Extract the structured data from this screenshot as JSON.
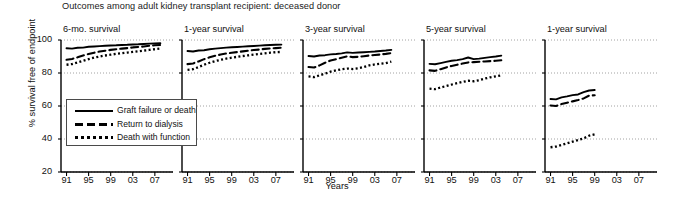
{
  "chart_data": {
    "type": "line",
    "title": "Outcomes among adult kidney transplant recipient: deceased donor",
    "xlabel": "Years",
    "ylabel": "% survival free of endpoint",
    "ylim": [
      20,
      100
    ],
    "yticks": [
      20,
      40,
      60,
      80,
      100
    ],
    "ytick_labels": [
      "20",
      "40",
      "60",
      "80",
      "100"
    ],
    "xticks": [
      91,
      95,
      99,
      3,
      7
    ],
    "xtick_labels": [
      "91",
      "95",
      "99",
      "03",
      "07"
    ],
    "xlim": [
      1990,
      2009
    ],
    "grid": "horizontal-dotted",
    "legend_position": "inside-lower-left-panel-1",
    "legend": [
      {
        "label": "Graft failure or death",
        "style": "solid"
      },
      {
        "label": "Return to dialysis",
        "style": "dashed"
      },
      {
        "label": "Death with function",
        "style": "dotted"
      }
    ],
    "panels": [
      {
        "title": "6-mo. survival",
        "x": [
          1991,
          1992,
          1993,
          1994,
          1995,
          1996,
          1997,
          1998,
          1999,
          2000,
          2001,
          2002,
          2003,
          2004,
          2005,
          2006,
          2007,
          2008
        ],
        "series": [
          {
            "name": "Graft failure or death",
            "style": "solid",
            "values": [
              95.0,
              94.8,
              95.3,
              95.4,
              95.9,
              96.1,
              96.3,
              96.5,
              96.7,
              96.8,
              97.0,
              97.1,
              97.3,
              97.4,
              97.6,
              97.8,
              97.9,
              98.0
            ]
          },
          {
            "name": "Return to dialysis",
            "style": "dashed",
            "values": [
              88.0,
              88.5,
              89.5,
              90.6,
              91.5,
              92.3,
              93.0,
              93.5,
              94.0,
              94.4,
              94.8,
              95.1,
              95.5,
              95.8,
              96.1,
              96.5,
              96.8,
              97.0
            ]
          },
          {
            "name": "Death with function",
            "style": "dotted",
            "values": [
              85.0,
              85.4,
              86.4,
              87.4,
              88.4,
              89.3,
              90.0,
              90.6,
              91.1,
              91.6,
              92.0,
              92.4,
              92.8,
              93.2,
              93.6,
              94.0,
              94.4,
              94.8
            ]
          }
        ]
      },
      {
        "title": "1-year survival",
        "x": [
          1991,
          1992,
          1993,
          1994,
          1995,
          1996,
          1997,
          1998,
          1999,
          2000,
          2001,
          2002,
          2003,
          2004,
          2005,
          2006,
          2007,
          2008
        ],
        "series": [
          {
            "name": "Graft failure or death",
            "style": "solid",
            "values": [
              93.3,
              93.0,
              93.6,
              93.8,
              94.4,
              94.8,
              95.1,
              95.4,
              95.6,
              95.8,
              96.0,
              96.2,
              96.4,
              96.6,
              96.8,
              97.0,
              97.1,
              97.2
            ]
          },
          {
            "name": "Return to dialysis",
            "style": "dashed",
            "values": [
              85.4,
              85.8,
              87.0,
              88.4,
              89.5,
              90.4,
              91.2,
              91.8,
              92.3,
              92.7,
              93.1,
              93.5,
              93.9,
              94.2,
              94.6,
              94.9,
              95.1,
              95.3
            ]
          },
          {
            "name": "Death with function",
            "style": "dotted",
            "values": [
              81.9,
              82.3,
              83.6,
              85.0,
              86.2,
              87.2,
              88.0,
              88.7,
              89.3,
              89.8,
              90.3,
              90.7,
              91.1,
              91.5,
              91.9,
              92.3,
              92.6,
              92.8
            ]
          }
        ]
      },
      {
        "title": "3-year survival",
        "x": [
          1991,
          1992,
          1993,
          1994,
          1995,
          1996,
          1997,
          1998,
          1999,
          2000,
          2001,
          2002,
          2003,
          2004,
          2005,
          2006
        ],
        "series": [
          {
            "name": "Graft failure or death",
            "style": "solid",
            "values": [
              90.3,
              90.0,
              90.6,
              90.8,
              91.3,
              91.5,
              91.9,
              92.5,
              92.2,
              92.4,
              92.6,
              92.8,
              93.0,
              93.3,
              93.6,
              94.0
            ]
          },
          {
            "name": "Return to dialysis",
            "style": "dashed",
            "values": [
              83.6,
              83.3,
              84.6,
              86.2,
              87.6,
              88.4,
              89.3,
              90.1,
              89.6,
              89.8,
              90.2,
              90.6,
              90.9,
              91.2,
              91.6,
              92.1
            ]
          },
          {
            "name": "Death with function",
            "style": "dotted",
            "values": [
              77.9,
              77.5,
              78.6,
              79.6,
              80.8,
              81.6,
              82.3,
              82.7,
              82.4,
              82.8,
              83.6,
              84.6,
              85.2,
              85.6,
              86.0,
              86.9
            ]
          }
        ]
      },
      {
        "title": "5-year survival",
        "x": [
          1991,
          1992,
          1993,
          1994,
          1995,
          1996,
          1997,
          1998,
          1999,
          2000,
          2001,
          2002,
          2003,
          2004
        ],
        "series": [
          {
            "name": "Graft failure or death",
            "style": "solid",
            "values": [
              85.5,
              85.3,
              86.0,
              86.7,
              87.4,
              87.8,
              88.4,
              89.4,
              88.4,
              88.7,
              89.2,
              89.6,
              90.0,
              90.5
            ]
          },
          {
            "name": "Return to dialysis",
            "style": "dashed",
            "values": [
              81.6,
              81.3,
              82.3,
              83.4,
              84.3,
              85.0,
              85.7,
              86.4,
              86.6,
              86.8,
              87.0,
              87.2,
              87.4,
              87.7
            ]
          },
          {
            "name": "Death with function",
            "style": "dotted",
            "values": [
              70.5,
              70.2,
              71.2,
              72.1,
              73.0,
              73.8,
              74.6,
              75.3,
              75.0,
              75.6,
              76.6,
              77.4,
              78.0,
              78.6
            ]
          }
        ]
      },
      {
        "title": "1-year survival",
        "x": [
          1991,
          1992,
          1993,
          1994,
          1995,
          1996,
          1997,
          1998,
          1999
        ],
        "series": [
          {
            "name": "Graft failure or death",
            "style": "solid",
            "values": [
              64.2,
              64.0,
              65.2,
              65.8,
              66.6,
              67.0,
              68.4,
              69.4,
              69.7
            ]
          },
          {
            "name": "Return to dialysis",
            "style": "dashed",
            "values": [
              60.3,
              60.0,
              61.2,
              62.0,
              62.8,
              63.6,
              64.6,
              66.3,
              66.5
            ]
          },
          {
            "name": "Death with function",
            "style": "dotted",
            "values": [
              35.0,
              35.4,
              36.4,
              37.4,
              38.4,
              39.4,
              40.4,
              42.0,
              42.8
            ]
          }
        ]
      }
    ]
  }
}
